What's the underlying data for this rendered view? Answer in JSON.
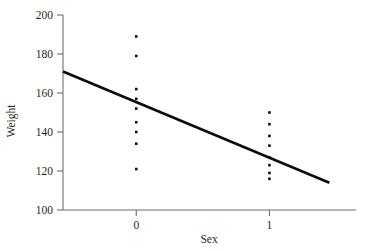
{
  "chart_data": {
    "type": "scatter",
    "title": "",
    "subtitle": "",
    "xlabel": "Sex",
    "ylabel": "Weight",
    "xlim": [
      -0.55,
      1.65
    ],
    "ylim": [
      100,
      200
    ],
    "x_ticks": [
      0,
      1
    ],
    "x_tick_labels": [
      "0",
      "1"
    ],
    "y_ticks": [
      100,
      120,
      140,
      160,
      180,
      200
    ],
    "y_tick_labels": [
      "100",
      "120",
      "140",
      "160",
      "180",
      "200"
    ],
    "grid": false,
    "legend": false,
    "legend_position": "none",
    "series": [
      {
        "name": "Observations",
        "type": "scatter",
        "marker": "square",
        "color": "#111111",
        "points": [
          {
            "x": 0,
            "y": 189
          },
          {
            "x": 0,
            "y": 179
          },
          {
            "x": 0,
            "y": 162
          },
          {
            "x": 0,
            "y": 157
          },
          {
            "x": 0,
            "y": 152
          },
          {
            "x": 0,
            "y": 145
          },
          {
            "x": 0,
            "y": 140
          },
          {
            "x": 0,
            "y": 134
          },
          {
            "x": 0,
            "y": 121
          },
          {
            "x": 1,
            "y": 150
          },
          {
            "x": 1,
            "y": 144
          },
          {
            "x": 1,
            "y": 138
          },
          {
            "x": 1,
            "y": 133
          },
          {
            "x": 1,
            "y": 127
          },
          {
            "x": 1,
            "y": 123
          },
          {
            "x": 1,
            "y": 119
          },
          {
            "x": 1,
            "y": 116
          }
        ]
      },
      {
        "name": "Regression line",
        "type": "line",
        "color": "#0d0d0d",
        "endpoints": [
          {
            "x": -0.55,
            "y": 171
          },
          {
            "x": 1.45,
            "y": 114
          }
        ],
        "intercept": 155.3,
        "slope": -28.5
      }
    ],
    "colors": {
      "point": "#111111",
      "line": "#0d0d0d",
      "axis": "#6e6e6e",
      "text": "#1f1f1f",
      "background": "#ffffff"
    }
  }
}
